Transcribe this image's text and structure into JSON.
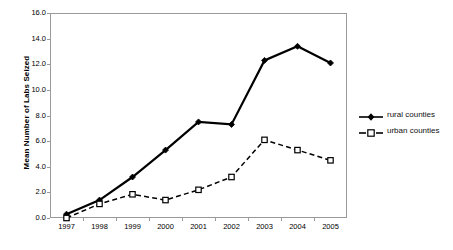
{
  "chart_data": {
    "type": "line",
    "title": "",
    "xlabel": "",
    "ylabel": "Mean Number of Labs Seized",
    "categories": [
      "1997",
      "1998",
      "1999",
      "2000",
      "2001",
      "2002",
      "2003",
      "2004",
      "2005"
    ],
    "ylim": [
      0.0,
      16.0
    ],
    "ytick_labels": [
      "16.0",
      "14.0",
      "12.0",
      "10.0",
      "8.0",
      "6.0",
      "4.0",
      "2.0",
      "0.0"
    ],
    "ytick_values": [
      16.0,
      14.0,
      12.0,
      10.0,
      8.0,
      6.0,
      4.0,
      2.0,
      0.0
    ],
    "grid": false,
    "legend_position": "right",
    "series": [
      {
        "name": "rural counties",
        "marker": "filled-diamond",
        "line_style": "solid",
        "color": "#000000",
        "values": [
          0.3,
          1.4,
          3.2,
          5.3,
          7.5,
          7.3,
          12.3,
          13.4,
          12.1
        ]
      },
      {
        "name": "urban counties",
        "marker": "open-square",
        "line_style": "dashed",
        "color": "#000000",
        "values": [
          0.0,
          1.1,
          1.85,
          1.4,
          2.2,
          3.2,
          6.1,
          5.3,
          4.5
        ]
      }
    ]
  },
  "legend": {
    "items": [
      {
        "label": "rural counties"
      },
      {
        "label": "urban counties"
      }
    ]
  },
  "axis": {
    "y_title": "Mean Number of Labs Seized"
  }
}
